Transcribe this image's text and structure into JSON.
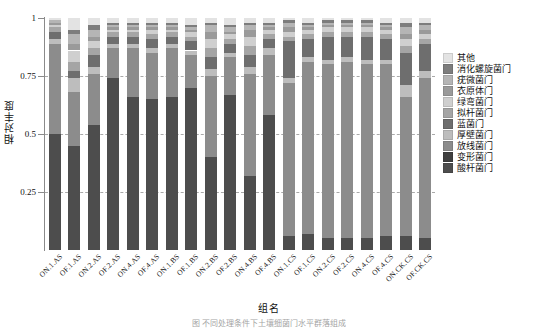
{
  "chart_data": {
    "type": "bar",
    "stacked": true,
    "normalized": true,
    "title": "",
    "xlabel": "组名",
    "ylabel": "相对丰度",
    "ylim": [
      0,
      1
    ],
    "yticks": [
      "0.25",
      "0.5",
      "0.75",
      "1"
    ],
    "ytick_values": [
      0.25,
      0.5,
      0.75,
      1
    ],
    "grid": "horizontal-dashed",
    "legend_position": "right",
    "categories": [
      "ON.1.AS",
      "OF.1.AS",
      "ON.2.AS",
      "OF.2.AS",
      "ON.4.AS",
      "OF.4.AS",
      "ON.1.BS",
      "OF.1.BS",
      "ON.2.BS",
      "OF.2.BS",
      "ON.4.BS",
      "OF.4.BS",
      "ON.1.CS",
      "OF.1.CS",
      "ON.2.CS",
      "OF.2.CS",
      "ON.4.CS",
      "OF.4.CS",
      "ON.CK.CS",
      "OF.CK.CS"
    ],
    "series": [
      {
        "name": "酸杆菌门",
        "color": "#4d4d4d",
        "values": [
          0.5,
          0.45,
          0.54,
          0.74,
          0.66,
          0.65,
          0.66,
          0.7,
          0.4,
          0.67,
          0.32,
          0.58,
          0.06,
          0.07,
          0.05,
          0.05,
          0.05,
          0.06,
          0.06,
          0.05
        ]
      },
      {
        "name": "变形菌门",
        "color": "#3f3f3f",
        "values": [
          0.0,
          0.0,
          0.0,
          0.0,
          0.0,
          0.0,
          0.0,
          0.0,
          0.0,
          0.0,
          0.0,
          0.0,
          0.0,
          0.0,
          0.0,
          0.0,
          0.0,
          0.0,
          0.0,
          0.0
        ]
      },
      {
        "name": "放线菌门",
        "color": "#8c8c8c",
        "values": [
          0.39,
          0.23,
          0.22,
          0.13,
          0.21,
          0.2,
          0.21,
          0.14,
          0.35,
          0.16,
          0.44,
          0.26,
          0.66,
          0.74,
          0.75,
          0.76,
          0.75,
          0.74,
          0.6,
          0.69
        ]
      },
      {
        "name": "厚壁菌门",
        "color": "#bdbdbd",
        "values": [
          0.02,
          0.06,
          0.03,
          0.02,
          0.02,
          0.02,
          0.02,
          0.02,
          0.03,
          0.02,
          0.03,
          0.03,
          0.02,
          0.02,
          0.02,
          0.02,
          0.02,
          0.02,
          0.05,
          0.03
        ]
      },
      {
        "name": "蓝菌门",
        "color": "#6e6e6e",
        "values": [
          0.03,
          0.03,
          0.05,
          0.03,
          0.03,
          0.04,
          0.03,
          0.04,
          0.05,
          0.04,
          0.05,
          0.04,
          0.16,
          0.08,
          0.1,
          0.09,
          0.1,
          0.09,
          0.14,
          0.12
        ]
      },
      {
        "name": "拟杆菌门",
        "color": "#a5a5a5",
        "values": [
          0.02,
          0.04,
          0.03,
          0.02,
          0.02,
          0.02,
          0.02,
          0.02,
          0.04,
          0.02,
          0.04,
          0.02,
          0.02,
          0.02,
          0.02,
          0.02,
          0.02,
          0.02,
          0.03,
          0.02
        ]
      },
      {
        "name": "绿弯菌门",
        "color": "#cfcfcf",
        "values": [
          0.01,
          0.05,
          0.03,
          0.01,
          0.01,
          0.02,
          0.01,
          0.02,
          0.04,
          0.02,
          0.04,
          0.02,
          0.02,
          0.02,
          0.02,
          0.02,
          0.02,
          0.02,
          0.03,
          0.02
        ]
      },
      {
        "name": "衣原体门",
        "color": "#9a9a9a",
        "values": [
          0.01,
          0.03,
          0.02,
          0.01,
          0.01,
          0.01,
          0.01,
          0.01,
          0.03,
          0.01,
          0.03,
          0.01,
          0.02,
          0.01,
          0.01,
          0.01,
          0.01,
          0.01,
          0.02,
          0.02
        ]
      },
      {
        "name": "疣微菌门",
        "color": "#b5b5b5",
        "values": [
          0.01,
          0.04,
          0.03,
          0.01,
          0.01,
          0.01,
          0.01,
          0.01,
          0.03,
          0.02,
          0.02,
          0.01,
          0.02,
          0.01,
          0.01,
          0.01,
          0.01,
          0.01,
          0.03,
          0.02
        ]
      },
      {
        "name": "消化螺旋菌门",
        "color": "#7d7d7d",
        "values": [
          0.0,
          0.02,
          0.02,
          0.01,
          0.01,
          0.01,
          0.01,
          0.01,
          0.01,
          0.01,
          0.01,
          0.01,
          0.01,
          0.01,
          0.01,
          0.01,
          0.01,
          0.01,
          0.02,
          0.01
        ]
      },
      {
        "name": "其他",
        "color": "#e3e3e3",
        "values": [
          0.01,
          0.05,
          0.03,
          0.02,
          0.02,
          0.02,
          0.02,
          0.03,
          0.02,
          0.03,
          0.02,
          0.02,
          0.01,
          0.02,
          0.01,
          0.01,
          0.01,
          0.02,
          0.02,
          0.02
        ]
      }
    ],
    "legend_order": [
      "其他",
      "消化螺旋菌门",
      "疣微菌门",
      "衣原体门",
      "绿弯菌门",
      "拟杆菌门",
      "蓝菌门",
      "厚壁菌门",
      "放线菌门",
      "变形菌门",
      "酸杆菌门"
    ]
  },
  "caption": "图  不同处理条件下土壤细菌门水平群落组成"
}
